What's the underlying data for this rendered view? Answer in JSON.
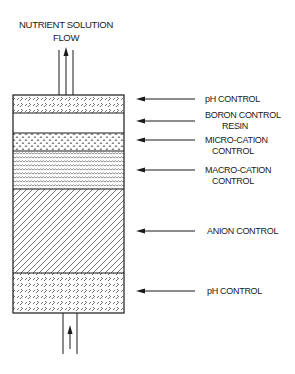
{
  "diagram": {
    "title_line1": "NUTRIENT SOLUTION",
    "title_line2": "FLOW",
    "flow_direction": "upward",
    "colors": {
      "line": "#1a1a1a",
      "background": "#ffffff"
    },
    "layers": [
      {
        "label_line1": "pH CONTROL",
        "label_line2": "",
        "pattern": "cross-hatch-dashes",
        "position": "top"
      },
      {
        "label_line1": "BORON CONTROL",
        "label_line2": "RESIN",
        "pattern": "blank"
      },
      {
        "label_line1": "MICRO-CATION",
        "label_line2": "CONTROL",
        "pattern": "small-carets"
      },
      {
        "label_line1": "MACRO-CATION",
        "label_line2": "CONTROL",
        "pattern": "wavy-lines"
      },
      {
        "label_line1": "ANION CONTROL",
        "label_line2": "",
        "pattern": "diagonal-hatch"
      },
      {
        "label_line1": "pH CONTROL",
        "label_line2": "",
        "pattern": "cross-hatch-dashes",
        "position": "bottom"
      }
    ]
  }
}
